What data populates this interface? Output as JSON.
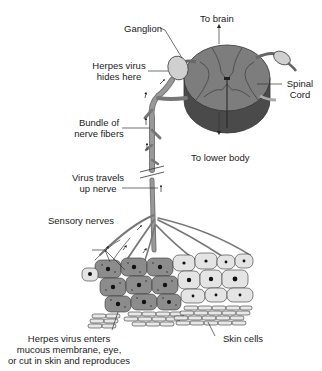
{
  "diagram": {
    "labels": {
      "to_brain": "To brain",
      "ganglion": "Ganglion",
      "herpes_hides_1": "Herpes virus",
      "herpes_hides_2": "hides here",
      "spinal_1": "Spinal",
      "spinal_2": "Cord",
      "bundle_1": "Bundle of",
      "bundle_2": "nerve fibers",
      "to_lower_body": "To lower body",
      "virus_travels_1": "Virus travels",
      "virus_travels_2": "up nerve",
      "sensory_nerves": "Sensory nerves",
      "enters_1": "Herpes virus enters",
      "enters_2": "mucous membrane, eye,",
      "enters_3": "or cut in skin and reproduces",
      "skin_cells": "Skin cells"
    },
    "colors": {
      "nerve": "#8a8a8a",
      "outline": "#333333",
      "cord_top": "#7d7d7d",
      "cord_side": "#4a4a4a",
      "ganglion": "#d0d0d0",
      "infected_cell": "#8c8c8c",
      "healthy_cell": "#e4e4e4"
    }
  }
}
